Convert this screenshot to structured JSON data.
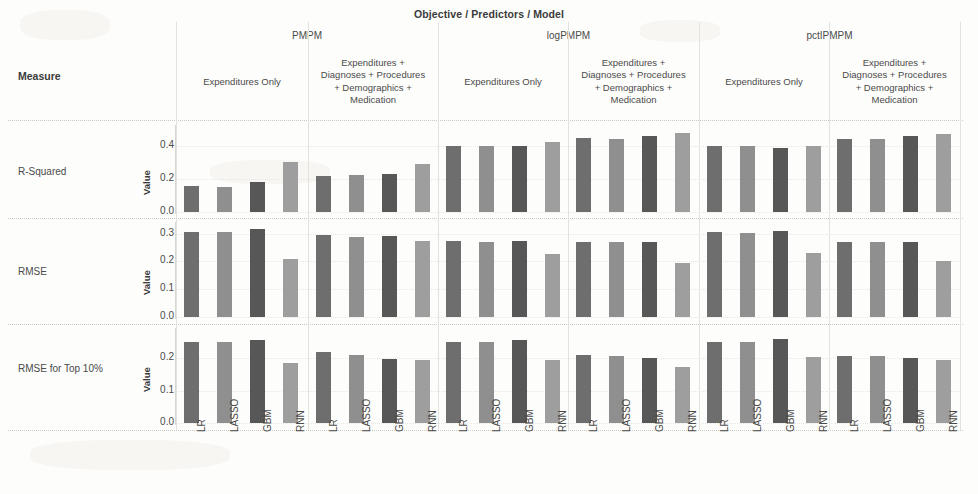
{
  "chart_title": "Objective / Predictors / Model",
  "header": {
    "measure_label": "Measure",
    "objectives": [
      "PMPM",
      "logPMPM",
      "pctIPMPM"
    ],
    "predictor_sets": [
      "Expenditures Only",
      "Expenditures +\nDiagnoses + Procedures\n+ Demographics +\nMedication"
    ]
  },
  "axis": {
    "value_title": "Value"
  },
  "colors": {
    "LR": "#6e6e6e",
    "LASSO": "#8f8f8f",
    "GBM": "#575757",
    "RNN": "#9e9e9e",
    "background": "#fdfdfb",
    "rule": "#c9c9c4",
    "text": "#4a4a4a"
  },
  "chart_data": {
    "type": "bar",
    "title": "Objective / Predictors / Model",
    "xlabel": "",
    "ylabel": "Value",
    "grid": true,
    "legend": "none",
    "models": [
      "LR",
      "LASSO",
      "GBM",
      "RNN"
    ],
    "objectives": [
      "PMPM",
      "logPMPM",
      "pctIPMPM"
    ],
    "predictor_sets": [
      "Expenditures Only",
      "Expenditures + Diagnoses + Procedures + Demographics + Medication"
    ],
    "measures": [
      {
        "name": "R-Squared",
        "ylim": [
          0.0,
          0.5
        ],
        "yticks": [
          0.0,
          0.2,
          0.4
        ],
        "panels": [
          {
            "objective": "PMPM",
            "predictors": "Expenditures Only",
            "values": [
              0.155,
              0.15,
              0.18,
              0.3
            ]
          },
          {
            "objective": "PMPM",
            "predictors": "Expenditures + Diagnoses + Procedures + Demographics + Medication",
            "values": [
              0.215,
              0.22,
              0.23,
              0.29
            ]
          },
          {
            "objective": "logPMPM",
            "predictors": "Expenditures Only",
            "values": [
              0.4,
              0.4,
              0.395,
              0.42
            ]
          },
          {
            "objective": "logPMPM",
            "predictors": "Expenditures + Diagnoses + Procedures + Demographics + Medication",
            "values": [
              0.445,
              0.44,
              0.455,
              0.475
            ]
          },
          {
            "objective": "pctIPMPM",
            "predictors": "Expenditures Only",
            "values": [
              0.4,
              0.395,
              0.385,
              0.398
            ]
          },
          {
            "objective": "pctIPMPM",
            "predictors": "Expenditures + Diagnoses + Procedures + Demographics + Medication",
            "values": [
              0.44,
              0.44,
              0.455,
              0.47
            ]
          }
        ]
      },
      {
        "name": "RMSE",
        "ylim": [
          0.0,
          0.33
        ],
        "yticks": [
          0.0,
          0.1,
          0.2,
          0.3
        ],
        "panels": [
          {
            "objective": "PMPM",
            "predictors": "Expenditures Only",
            "values": [
              0.305,
              0.305,
              0.315,
              0.207
            ]
          },
          {
            "objective": "PMPM",
            "predictors": "Expenditures + Diagnoses + Procedures + Demographics + Medication",
            "values": [
              0.295,
              0.288,
              0.29,
              0.273
            ]
          },
          {
            "objective": "logPMPM",
            "predictors": "Expenditures Only",
            "values": [
              0.272,
              0.27,
              0.273,
              0.225
            ]
          },
          {
            "objective": "logPMPM",
            "predictors": "Expenditures + Diagnoses + Procedures + Demographics + Medication",
            "values": [
              0.27,
              0.268,
              0.27,
              0.196
            ]
          },
          {
            "objective": "pctIPMPM",
            "predictors": "Expenditures Only",
            "values": [
              0.305,
              0.303,
              0.31,
              0.232
            ]
          },
          {
            "objective": "pctIPMPM",
            "predictors": "Expenditures + Diagnoses + Procedures + Demographics + Medication",
            "values": [
              0.27,
              0.268,
              0.268,
              0.203
            ]
          }
        ]
      },
      {
        "name": "RMSE for Top 10%",
        "ylim": [
          0.0,
          0.28
        ],
        "yticks": [
          0.0,
          0.1,
          0.2
        ],
        "panels": [
          {
            "objective": "PMPM",
            "predictors": "Expenditures Only",
            "values": [
              0.25,
              0.25,
              0.255,
              0.185
            ]
          },
          {
            "objective": "PMPM",
            "predictors": "Expenditures + Diagnoses + Procedures + Demographics + Medication",
            "values": [
              0.218,
              0.21,
              0.196,
              0.193
            ]
          },
          {
            "objective": "logPMPM",
            "predictors": "Expenditures Only",
            "values": [
              0.25,
              0.25,
              0.256,
              0.193
            ]
          },
          {
            "objective": "logPMPM",
            "predictors": "Expenditures + Diagnoses + Procedures + Demographics + Medication",
            "values": [
              0.208,
              0.207,
              0.2,
              0.172
            ]
          },
          {
            "objective": "pctIPMPM",
            "predictors": "Expenditures Only",
            "values": [
              0.25,
              0.25,
              0.257,
              0.203
            ]
          },
          {
            "objective": "pctIPMPM",
            "predictors": "Expenditures + Diagnoses + Procedures + Demographics + Medication",
            "values": [
              0.207,
              0.205,
              0.2,
              0.193
            ]
          }
        ]
      }
    ]
  }
}
